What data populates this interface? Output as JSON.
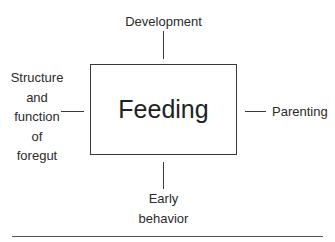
{
  "diagram": {
    "center": {
      "label": "Feeding"
    },
    "top": {
      "label": "Development"
    },
    "right": {
      "label": "Parenting"
    },
    "left": {
      "lines": [
        "Structure",
        "and",
        "function",
        "of",
        "foregut"
      ]
    },
    "bottom": {
      "lines": [
        "Early",
        "behavior"
      ]
    }
  }
}
